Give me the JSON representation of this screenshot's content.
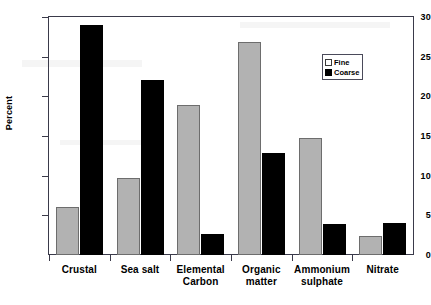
{
  "chart_data": {
    "type": "bar",
    "title": "",
    "xlabel": "",
    "ylabel": "Percent",
    "ylim": [
      0,
      30
    ],
    "ytick_values": [
      0,
      5,
      10,
      15,
      20,
      25,
      30
    ],
    "ytick_labels": [
      "0",
      "5",
      "10",
      "15",
      "20",
      "25",
      "30"
    ],
    "grid": false,
    "legend_position": "top-right-inside",
    "categories": [
      "Crustal",
      "Sea salt",
      "Elemental Carbon",
      "Organic matter",
      "Ammonium sulphate",
      "Nitrate"
    ],
    "category_lines": [
      [
        "Crustal",
        ""
      ],
      [
        "Sea salt",
        ""
      ],
      [
        "Elemental",
        "Carbon"
      ],
      [
        "Organic",
        "matter"
      ],
      [
        "Ammonium",
        "sulphate"
      ],
      [
        "Nitrate",
        ""
      ]
    ],
    "series": [
      {
        "name": "Fine",
        "color": "#b2b2b2",
        "values": [
          6.1,
          9.7,
          18.9,
          26.8,
          14.8,
          2.4
        ]
      },
      {
        "name": "Coarse",
        "color": "#000000",
        "values": [
          29.0,
          22.0,
          2.7,
          12.9,
          3.9,
          4.0
        ]
      }
    ]
  },
  "legend": {
    "items": [
      {
        "label": "Fine",
        "swatch": "fine"
      },
      {
        "label": "Coarse",
        "swatch": "coarse"
      }
    ]
  },
  "axes": {
    "y_axis_title": "Percent"
  }
}
